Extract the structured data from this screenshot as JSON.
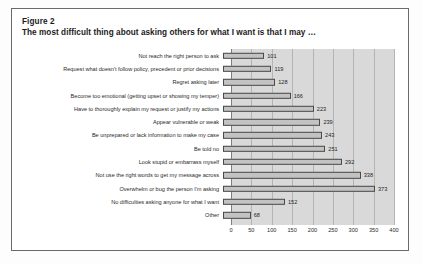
{
  "figure": {
    "label": "Figure 2",
    "caption": "The most difficult thing about asking others for what I want is that I may …"
  },
  "chart_data": {
    "type": "bar",
    "orientation": "horizontal",
    "title": "The most difficult thing about asking others for what I want is that I may …",
    "xlabel": "",
    "ylabel": "",
    "xlim": [
      0,
      400
    ],
    "grid": true,
    "legend": false,
    "bar_color": "#c3c3c3",
    "bar_border_color": "#4a4a4a",
    "plot_background": "#d9d9d9",
    "xticks": [
      "0",
      "50",
      "100",
      "150",
      "200",
      "250",
      "300",
      "350",
      "400"
    ],
    "xtick_values": [
      0,
      50,
      100,
      150,
      200,
      250,
      300,
      350,
      400
    ],
    "categories": [
      "Not reach the right person to ask",
      "Request what doesn't follow policy, precedent or prior decisions",
      "Regret asking later",
      "Become too emotional (getting upset or showing my temper)",
      "Have to thoroughly explain my request or justify my actions",
      "Appear vulnerable or weak",
      "Be unprepared or lack information to make my case",
      "Be told no",
      "Look stupid or embarrass myself",
      "Not use the right words to get my message across",
      "Overwhelm or bug the person I'm asking",
      "No difficulties asking anyone for what I want",
      "Other"
    ],
    "values": [
      101,
      119,
      128,
      166,
      223,
      239,
      243,
      251,
      292,
      338,
      373,
      152,
      68
    ],
    "value_labels": [
      "101",
      "119",
      "128",
      "166",
      "223",
      "239",
      "243",
      "251",
      "292",
      "338",
      "373",
      "152",
      "68"
    ]
  }
}
